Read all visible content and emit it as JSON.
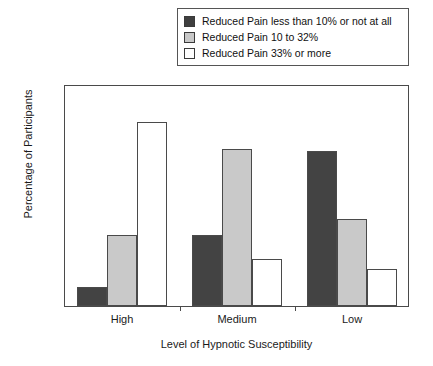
{
  "legend": {
    "position": "top",
    "items": [
      {
        "label": "Reduced Pain less than 10% or not at all",
        "swatch": "dark-swatch",
        "color": "#3f3f3f"
      },
      {
        "label": "Reduced Pain 10 to 32%",
        "swatch": "gray-swatch",
        "color": "#c8c8c8"
      },
      {
        "label": "Reduced Pain 33% or more",
        "swatch": "white-swatch",
        "color": "#ffffff"
      }
    ]
  },
  "chart_data": {
    "type": "bar",
    "title": "",
    "xlabel": "Level of Hypnotic Susceptibility",
    "ylabel": "Percentage of Participants",
    "categories": [
      "High",
      "Medium",
      "Low"
    ],
    "series": [
      {
        "name": "Reduced Pain less than 10% or not at all",
        "color": "#3f3f3f",
        "values": [
          7,
          26,
          56.5
        ]
      },
      {
        "name": "Reduced Pain 10 to 32%",
        "color": "#c8c8c8",
        "values": [
          26,
          57,
          31.5
        ]
      },
      {
        "name": "Reduced Pain 33% or more",
        "color": "#ffffff",
        "values": [
          67,
          17,
          13.5
        ]
      }
    ],
    "ylim": [
      0,
      80
    ],
    "yticks": [
      0,
      10,
      20,
      30,
      40,
      50,
      60,
      70,
      80
    ],
    "ytick_labels": [
      "0",
      "10",
      "20",
      "30",
      "40",
      "50",
      "60",
      "70",
      "80"
    ],
    "grid": false,
    "legend_position": "top"
  }
}
